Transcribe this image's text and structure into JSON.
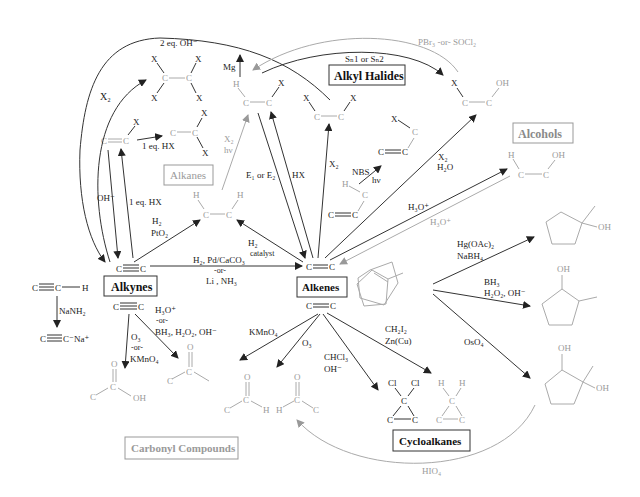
{
  "diagram": {
    "title_hidden": "",
    "categories": {
      "alkyl_halides": "Alkyl Halides",
      "alcohols": "Alcohols",
      "alkanes": "Alkanes",
      "alkynes": "Alkynes",
      "alkenes": "Alkenes",
      "carbonyl": "Carbonyl Compounds",
      "cycloalkanes": "Cycloalkanes"
    },
    "reagents": {
      "two_eq_oh": "2 eq. OH⁻",
      "x2_left": "X₂",
      "one_eq_hx_top": "1 eq. HX",
      "oh_minus": "OH⁻",
      "one_eq_hx_side": "1 eq. HX",
      "h2_pto2_a": "H₂",
      "h2_pto2_b": "PtO₂",
      "mg": "Mg",
      "x2_hv_a": "X₂",
      "x2_hv_b": "hν",
      "e1_e2": "E₁ or E₂",
      "hx": "HX",
      "x2_mid": "X₂",
      "nbs": "NBS",
      "hv": "hν",
      "sn": "Sₙ1 or Sₙ2",
      "pbr3": "PBr₃ -or- SOCl₂",
      "x2_h2o_a": "X₂",
      "x2_h2o_b": "H₂O",
      "h3o_a": "H₃O⁺",
      "h3o_b": "H₃O⁺",
      "h2_catalyst_a": "H₂",
      "h2_catalyst_b": "catalyst",
      "lindlar_a": "H₂, Pd/CaCO₃",
      "lindlar_b": "-or-",
      "lindlar_c": "Li , NH₃",
      "nanh2": "NaNH₂",
      "h3o_alkyne_a": "H₃O⁺",
      "h3o_alkyne_b": "-or-",
      "h3o_alkyne_c": "BH₃, H₂O₂, OH⁻",
      "o3_a": "O₃",
      "o3_b": "-or-",
      "o3_c": "KMnO₄",
      "kmno4": "KMnO₄",
      "o3_alkene": "O₃",
      "chcl3_a": "CHCl₃",
      "chcl3_b": "OH⁻",
      "ch2i2_a": "CH₂I₂",
      "ch2i2_b": "Zn(Cu)",
      "hgoac_a": "Hg(OAc)₂",
      "hgoac_b": "NaBH₄",
      "bh3_a": "BH₃",
      "bh3_b": "H₂O₂, OH⁻",
      "oso4": "OsO₄",
      "hio4": "HIO₄"
    },
    "atoms": {
      "C": "C",
      "H": "H",
      "X": "X",
      "OH": "OH",
      "O": "O",
      "Cl": "Cl",
      "Na": "Na⁺",
      "Cminus": "C⁻"
    },
    "colors": {
      "dark": "#333333",
      "gray": "#9a9a9a",
      "background": "#ffffff"
    }
  }
}
